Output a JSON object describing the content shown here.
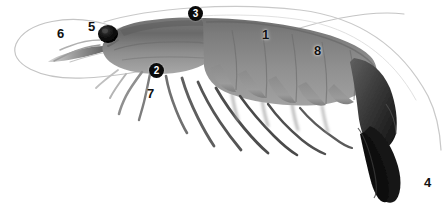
{
  "figure": {
    "caption": "",
    "background_color": "#ffffff",
    "image_width": 442,
    "image_height": 212,
    "view": "lateral left side"
  },
  "palette": {
    "label_text_dark": "#111111",
    "badge_fill": "#0a0a0a",
    "badge_text": "#ffffff",
    "body_mid_gray": "#8c8c8c",
    "body_dark_gray": "#5e5e5e",
    "body_light_gray": "#b9b9b9",
    "tail_black": "#141414",
    "eye_black": "#0b0b0b",
    "antenna_gray": "#c9c9c9",
    "outline_gray": "#9a9a9a"
  },
  "labels": [
    {
      "id": "label-1",
      "text": "1",
      "style": "plain",
      "x": 262,
      "y": 28,
      "part": "abdomen"
    },
    {
      "id": "label-2",
      "text": "2",
      "style": "badge",
      "x": 149,
      "y": 63,
      "part": "third-maxilliped"
    },
    {
      "id": "label-3",
      "text": "3",
      "style": "badge",
      "x": 188,
      "y": 6,
      "part": "carapace-dorsal"
    },
    {
      "id": "label-4",
      "text": "4",
      "style": "plain",
      "x": 424,
      "y": 176,
      "part": "telson-uropod-tail-fan"
    },
    {
      "id": "label-5",
      "text": "5",
      "style": "plain",
      "x": 88,
      "y": 20,
      "part": "eye"
    },
    {
      "id": "label-6",
      "text": "6",
      "style": "plain",
      "x": 57,
      "y": 27,
      "part": "antennule-rostrum"
    },
    {
      "id": "label-7",
      "text": "7",
      "style": "plain",
      "x": 147,
      "y": 87,
      "part": "pereiopods-walking-legs"
    },
    {
      "id": "label-8",
      "text": "8",
      "style": "plain",
      "x": 314,
      "y": 44,
      "part": "pleura-abdominal-segment"
    }
  ]
}
